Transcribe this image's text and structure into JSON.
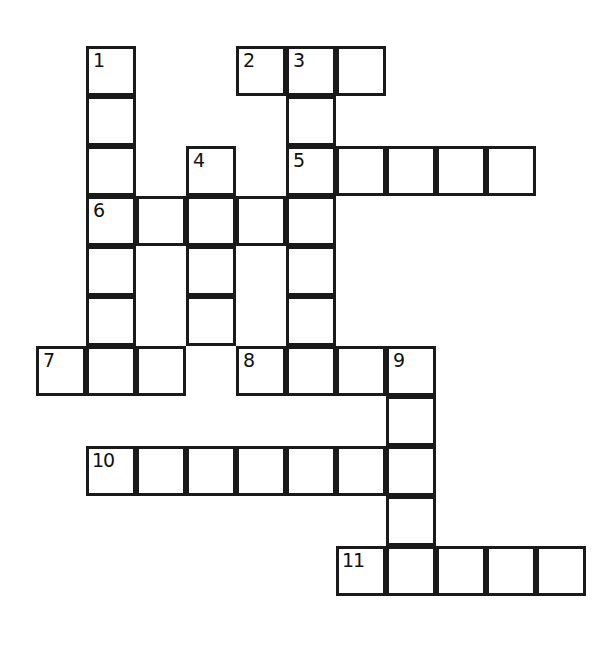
{
  "puzzle": {
    "title": "Crossword Puzzle Grid",
    "background_color": "#ffffff",
    "cell_fill_color": "#ffffff",
    "cell_border_color": "#1a1a1a",
    "number_color": "#111111",
    "cell_size_px": 50,
    "border_width_px": 3,
    "origin_x_px": 36,
    "origin_y_px": 46,
    "columns": 12,
    "rows": 12,
    "total_cells": 52,
    "numbered_clue_count": 11
  },
  "numbers": {
    "n1": "1",
    "n2": "2",
    "n3": "3",
    "n4": "4",
    "n5": "5",
    "n6": "6",
    "n7": "7",
    "n8": "8",
    "n9": "9",
    "n10": "10",
    "n11": "11"
  },
  "entries": [
    {
      "number": "1",
      "direction": "down",
      "start_col": 1,
      "start_row": 0,
      "length": 7
    },
    {
      "number": "2",
      "direction": "across",
      "start_col": 4,
      "start_row": 0,
      "length": 3
    },
    {
      "number": "3",
      "direction": "down",
      "start_col": 5,
      "start_row": 0,
      "length": 7
    },
    {
      "number": "4",
      "direction": "down",
      "start_col": 3,
      "start_row": 2,
      "length": 4
    },
    {
      "number": "5",
      "direction": "across",
      "start_col": 5,
      "start_row": 2,
      "length": 5
    },
    {
      "number": "6",
      "direction": "across",
      "start_col": 1,
      "start_row": 3,
      "length": 5
    },
    {
      "number": "7",
      "direction": "across",
      "start_col": 0,
      "start_row": 6,
      "length": 3
    },
    {
      "number": "8",
      "direction": "across",
      "start_col": 4,
      "start_row": 6,
      "length": 4
    },
    {
      "number": "9",
      "direction": "down",
      "start_col": 7,
      "start_row": 6,
      "length": 5
    },
    {
      "number": "10",
      "direction": "across",
      "start_col": 1,
      "start_row": 8,
      "length": 7
    },
    {
      "number": "11",
      "direction": "across",
      "start_col": 6,
      "start_row": 10,
      "length": 5
    }
  ],
  "cells": [
    {
      "name": "cell-r0c1",
      "col": 1,
      "row": 0,
      "number": "1"
    },
    {
      "name": "cell-r0c4",
      "col": 4,
      "row": 0,
      "number": "2"
    },
    {
      "name": "cell-r0c5",
      "col": 5,
      "row": 0,
      "number": "3"
    },
    {
      "name": "cell-r0c6",
      "col": 6,
      "row": 0,
      "number": ""
    },
    {
      "name": "cell-r1c1",
      "col": 1,
      "row": 1,
      "number": ""
    },
    {
      "name": "cell-r1c5",
      "col": 5,
      "row": 1,
      "number": ""
    },
    {
      "name": "cell-r2c1",
      "col": 1,
      "row": 2,
      "number": ""
    },
    {
      "name": "cell-r2c3",
      "col": 3,
      "row": 2,
      "number": "4"
    },
    {
      "name": "cell-r2c5",
      "col": 5,
      "row": 2,
      "number": "5"
    },
    {
      "name": "cell-r2c6",
      "col": 6,
      "row": 2,
      "number": ""
    },
    {
      "name": "cell-r2c7",
      "col": 7,
      "row": 2,
      "number": ""
    },
    {
      "name": "cell-r2c8",
      "col": 8,
      "row": 2,
      "number": ""
    },
    {
      "name": "cell-r2c9",
      "col": 9,
      "row": 2,
      "number": ""
    },
    {
      "name": "cell-r3c1",
      "col": 1,
      "row": 3,
      "number": "6"
    },
    {
      "name": "cell-r3c2",
      "col": 2,
      "row": 3,
      "number": ""
    },
    {
      "name": "cell-r3c3",
      "col": 3,
      "row": 3,
      "number": ""
    },
    {
      "name": "cell-r3c4",
      "col": 4,
      "row": 3,
      "number": ""
    },
    {
      "name": "cell-r3c5",
      "col": 5,
      "row": 3,
      "number": ""
    },
    {
      "name": "cell-r4c1",
      "col": 1,
      "row": 4,
      "number": ""
    },
    {
      "name": "cell-r4c3",
      "col": 3,
      "row": 4,
      "number": ""
    },
    {
      "name": "cell-r4c5",
      "col": 5,
      "row": 4,
      "number": ""
    },
    {
      "name": "cell-r5c1",
      "col": 1,
      "row": 5,
      "number": ""
    },
    {
      "name": "cell-r5c3",
      "col": 3,
      "row": 5,
      "number": ""
    },
    {
      "name": "cell-r5c5",
      "col": 5,
      "row": 5,
      "number": ""
    },
    {
      "name": "cell-r6c0",
      "col": 0,
      "row": 6,
      "number": "7"
    },
    {
      "name": "cell-r6c1",
      "col": 1,
      "row": 6,
      "number": ""
    },
    {
      "name": "cell-r6c2",
      "col": 2,
      "row": 6,
      "number": ""
    },
    {
      "name": "cell-r6c4",
      "col": 4,
      "row": 6,
      "number": "8"
    },
    {
      "name": "cell-r6c5",
      "col": 5,
      "row": 6,
      "number": ""
    },
    {
      "name": "cell-r6c6",
      "col": 6,
      "row": 6,
      "number": ""
    },
    {
      "name": "cell-r6c7",
      "col": 7,
      "row": 6,
      "number": "9"
    },
    {
      "name": "cell-r7c7",
      "col": 7,
      "row": 7,
      "number": ""
    },
    {
      "name": "cell-r8c1",
      "col": 1,
      "row": 8,
      "number": "10"
    },
    {
      "name": "cell-r8c2",
      "col": 2,
      "row": 8,
      "number": ""
    },
    {
      "name": "cell-r8c3",
      "col": 3,
      "row": 8,
      "number": ""
    },
    {
      "name": "cell-r8c4",
      "col": 4,
      "row": 8,
      "number": ""
    },
    {
      "name": "cell-r8c5",
      "col": 5,
      "row": 8,
      "number": ""
    },
    {
      "name": "cell-r8c6",
      "col": 6,
      "row": 8,
      "number": ""
    },
    {
      "name": "cell-r8c7",
      "col": 7,
      "row": 8,
      "number": ""
    },
    {
      "name": "cell-r9c7",
      "col": 7,
      "row": 9,
      "number": ""
    },
    {
      "name": "cell-r10c6",
      "col": 6,
      "row": 10,
      "number": "11"
    },
    {
      "name": "cell-r10c7",
      "col": 7,
      "row": 10,
      "number": ""
    },
    {
      "name": "cell-r10c8",
      "col": 8,
      "row": 10,
      "number": ""
    },
    {
      "name": "cell-r10c9",
      "col": 9,
      "row": 10,
      "number": ""
    },
    {
      "name": "cell-r10c10",
      "col": 10,
      "row": 10,
      "number": ""
    }
  ]
}
